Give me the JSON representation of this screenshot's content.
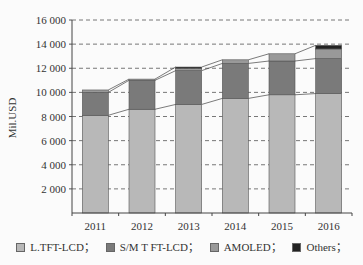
{
  "chart_data": {
    "type": "bar",
    "stacked": true,
    "title": "",
    "xlabel": "",
    "ylabel": "Mil.USD",
    "ylim": [
      0,
      16000
    ],
    "yticks": [
      2000,
      4000,
      6000,
      8000,
      10000,
      12000,
      14000,
      16000
    ],
    "ytick_labels": [
      "2 000",
      "4 000",
      "6 000",
      "8 000",
      "10 000",
      "12 000",
      "14 000",
      "16 000"
    ],
    "grid": "horizontal dashed",
    "legend_position": "bottom",
    "categories": [
      "2011",
      "2012",
      "2013",
      "2014",
      "2015",
      "2016"
    ],
    "series": [
      {
        "name": "L.TFT-LCD",
        "color": "#b8b8b8",
        "values": [
          8100,
          8600,
          9000,
          9500,
          9800,
          9900
        ]
      },
      {
        "name": "S/M T FT-LCD",
        "color": "#7a7a7a",
        "values": [
          1900,
          2400,
          2800,
          2900,
          2800,
          2900
        ]
      },
      {
        "name": "AMOLED",
        "color": "#999999",
        "values": [
          200,
          100,
          200,
          300,
          600,
          800
        ]
      },
      {
        "name": "Others",
        "color": "#222222",
        "values": [
          0,
          0,
          100,
          0,
          0,
          300
        ]
      }
    ],
    "connector_lines": true
  },
  "legend": {
    "items": [
      {
        "label": "L.TFT-LCD；",
        "color": "#b8b8b8"
      },
      {
        "label": "S/M T FT-LCD；",
        "color": "#7a7a7a"
      },
      {
        "label": "AMOLED；",
        "color": "#999999"
      },
      {
        "label": "Others；",
        "color": "#222222"
      }
    ]
  }
}
